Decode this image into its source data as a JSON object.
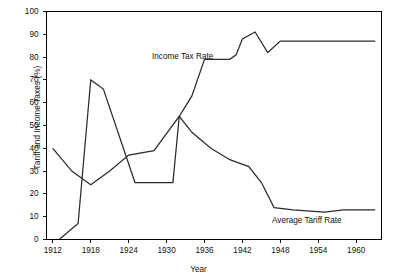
{
  "chart_data": {
    "type": "line",
    "title": "",
    "xlabel": "Year",
    "ylabel": "Tariff and Income Taxes (%)",
    "xlim": [
      1911,
      1964
    ],
    "ylim": [
      0,
      100
    ],
    "yticks": [
      0,
      10,
      20,
      30,
      40,
      50,
      60,
      70,
      80,
      90,
      100
    ],
    "xticks": [
      1912,
      1918,
      1924,
      1930,
      1936,
      1942,
      1948,
      1954,
      1960
    ],
    "grid": false,
    "legend_position": "inline-annotation",
    "series": [
      {
        "name": "Income Tax Rate",
        "label_x": 1929,
        "label_y": 74,
        "points": [
          [
            1913,
            0
          ],
          [
            1916,
            7
          ],
          [
            1918,
            70
          ],
          [
            1920,
            66
          ],
          [
            1925,
            25
          ],
          [
            1931,
            25
          ],
          [
            1932,
            54
          ],
          [
            1934,
            63
          ],
          [
            1936,
            79
          ],
          [
            1940,
            79
          ],
          [
            1941,
            81
          ],
          [
            1942,
            88
          ],
          [
            1944,
            91
          ],
          [
            1946,
            82
          ],
          [
            1948,
            87
          ],
          [
            1963,
            87
          ]
        ]
      },
      {
        "name": "Average Tariff Rate",
        "label_x": 1950,
        "label_y": 8,
        "points": [
          [
            1912,
            40
          ],
          [
            1915,
            30
          ],
          [
            1918,
            24
          ],
          [
            1921,
            30
          ],
          [
            1924,
            37
          ],
          [
            1928,
            39
          ],
          [
            1932,
            54
          ],
          [
            1934,
            47
          ],
          [
            1937,
            40
          ],
          [
            1940,
            35
          ],
          [
            1943,
            32
          ],
          [
            1945,
            25
          ],
          [
            1947,
            14
          ],
          [
            1950,
            13
          ],
          [
            1955,
            12
          ],
          [
            1958,
            13
          ],
          [
            1963,
            13
          ]
        ]
      }
    ]
  },
  "axes": {
    "y_tick_labels": [
      "100",
      "90",
      "80",
      "70",
      "60",
      "50",
      "40",
      "30",
      "20",
      "10",
      "0"
    ],
    "x_tick_labels": [
      "1912",
      "1918",
      "1924",
      "1930",
      "1936",
      "1942",
      "1948",
      "1954",
      "1960"
    ],
    "y_axis_title": "Tariff and Income Taxes (%)",
    "x_axis_title": "Year"
  },
  "annotations": {
    "income_tax_label": "Income Tax Rate",
    "tariff_label": "Average Tariff Rate"
  },
  "colors": {
    "line": "#2b2b2b",
    "axis": "#000000",
    "background": "#ffffff",
    "text": "#111111"
  }
}
